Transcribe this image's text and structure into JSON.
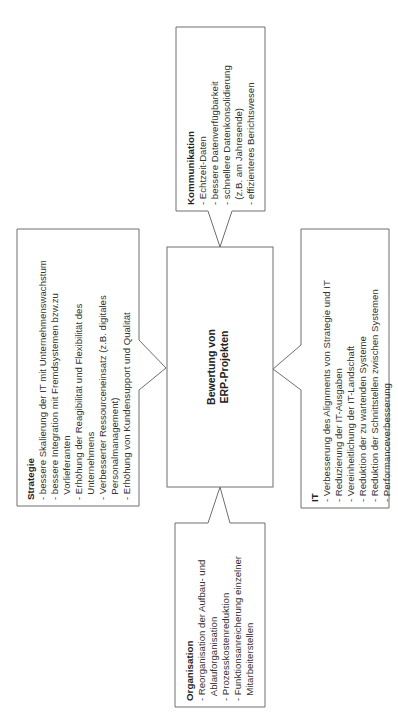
{
  "diagram": {
    "center": {
      "line1": "Bewertung von",
      "line2": "ERP-Projekten"
    },
    "kommunikation": {
      "title": "Kommunikation",
      "lines": [
        "- Echtzeit-Daten",
        "- bessere Datenverfügbarkeit",
        "- schnellere Datenkonsolidierung",
        "  (z.B. am Jahresende)",
        "- effizienteres Berichtswesen"
      ]
    },
    "strategie": {
      "title": "Strategie",
      "lines": [
        "- bessere Skalierung der IT mit Unternehmenswachstum",
        "- bessere Integration mit Fremdsystemen bzw.zu",
        "  Vorlieferanten",
        "- Erhöhung der Reagibilität und Flexibilität des",
        "  Unternehmens",
        "- Verbesserter Ressourceneinsatz (z.B. digitales",
        "  Personalmanagement)",
        "- Erhöhung von Kundensupport und Qualität"
      ]
    },
    "it": {
      "title": "IT",
      "lines": [
        "- Verbesserung des Alignments von Strategie und IT",
        "- Reduzierung der IT-Ausgaben",
        "- Vereinheitlichung der IT-Landschaft",
        "- Reduktion der zu wartenden Systeme",
        "- Reduktion der Schnittstellen zwischen Systemen",
        "- Performanceverbesserung"
      ]
    },
    "organisation": {
      "title": "Organisation",
      "lines": [
        "- Reorganisation der Aufbau- und",
        "  Ablauforganisation",
        "- Prozesskostenreduktion",
        "- Funktionsanreicherung einzelner",
        "  Mitarbeiterstellen"
      ]
    },
    "colors": {
      "stroke": "#6e6e6e",
      "text": "#333333",
      "background": "#ffffff"
    }
  }
}
